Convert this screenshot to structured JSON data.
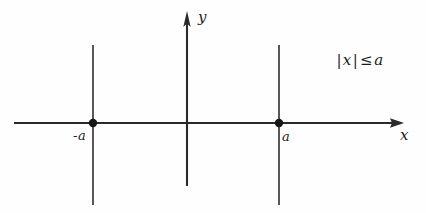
{
  "figure": {
    "background_color": "#fefefe",
    "ink_color": "#2a2a2a",
    "width": 426,
    "height": 213
  },
  "axes": {
    "x_axis": {
      "label": "x",
      "y_position": 123,
      "x_start": 14,
      "x_end": 404,
      "arrow": "right"
    },
    "y_axis": {
      "label": "y",
      "x_position": 187,
      "y_top": 12,
      "y_bottom": 186,
      "arrow": "up"
    }
  },
  "markers": [
    {
      "name": "point-neg-a",
      "label": "-a",
      "cx": 93,
      "cy": 123,
      "radius": 4.2
    },
    {
      "name": "point-pos-a",
      "label": "a",
      "cx": 279,
      "cy": 123,
      "radius": 4.2
    }
  ],
  "boundary_lines": [
    {
      "name": "vertical-line-neg-a",
      "x": 93,
      "y_top": 45,
      "y_bottom": 205
    },
    {
      "name": "vertical-line-pos-a",
      "x": 279,
      "y_top": 45,
      "y_bottom": 205
    }
  ],
  "annotation": {
    "full_text": "|x| ≤ a",
    "bar_left": "|",
    "variable": "x",
    "bar_right": "|",
    "operator": "≤",
    "bound": "a"
  }
}
